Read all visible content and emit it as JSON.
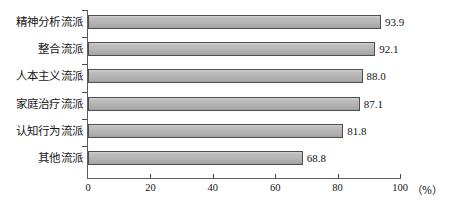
{
  "chart_data": {
    "type": "bar",
    "orientation": "horizontal",
    "title": "",
    "subtitle": "",
    "xlabel": "",
    "ylabel": "",
    "unit_label": "（%）",
    "xlim": [
      0,
      100
    ],
    "xticks": [
      0,
      20,
      40,
      60,
      80,
      100
    ],
    "xtick_labels": [
      "0",
      "20",
      "40",
      "60",
      "80",
      "100"
    ],
    "grid": false,
    "legend": false,
    "legend_position": "none",
    "categories": [
      "精神分析流派",
      "整合流派",
      "人本主义流派",
      "家庭治疗流派",
      "认知行为流派",
      "其他流派"
    ],
    "values": [
      93.9,
      92.1,
      88.0,
      87.1,
      81.8,
      68.8
    ],
    "value_labels": [
      "93.9",
      "92.1",
      "88.0",
      "87.1",
      "81.8",
      "68.8"
    ],
    "series": [
      {
        "name": "",
        "values": [
          93.9,
          92.1,
          88.0,
          87.1,
          81.8,
          68.8
        ]
      }
    ]
  },
  "colors": {
    "bar_fill": "#b4b4b4",
    "bar_border": "#4f4f4f",
    "axis": "#5d5d5d",
    "text": "#141414",
    "background": "#ffffff"
  }
}
